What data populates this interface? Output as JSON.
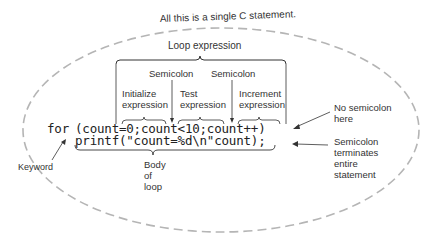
{
  "diagram": {
    "title": "All this is a single C statement.",
    "loop_expression_label": "Loop expression",
    "semicolon_labels": [
      "Semicolon",
      "Semicolon"
    ],
    "sub_expressions": [
      {
        "line1": "Initialize",
        "line2": "expression"
      },
      {
        "line1": "Test",
        "line2": "expression"
      },
      {
        "line1": "Increment",
        "line2": "expression"
      }
    ],
    "code": {
      "keyword": "for",
      "loop_header": "(count=0;count<10;count++)",
      "body": "printf(\"count=%d\\n\"count);"
    },
    "annotations": {
      "keyword": "Keyword",
      "no_semicolon": {
        "line1": "No semicolon",
        "line2": "here"
      },
      "terminator": {
        "line1": "Semicolon",
        "line2": "terminates",
        "line3": "entire",
        "line4": "statement"
      },
      "body": {
        "line1": "Body",
        "line2": "of",
        "line3": "loop"
      }
    },
    "colors": {
      "ellipse_dash": "#b0b0b0",
      "lines": "#333333",
      "text": "#2a2a2a"
    }
  }
}
